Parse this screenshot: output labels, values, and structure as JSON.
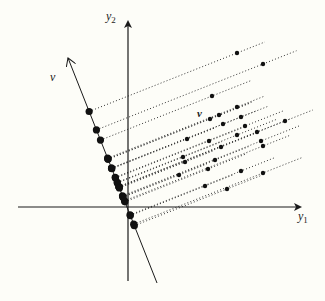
{
  "figure": {
    "background": "#fdfdf8",
    "ink": "#1a1a1a",
    "axis_labels": {
      "x": "y",
      "x_sub": "1",
      "y": "y",
      "y_sub": "2",
      "direction": "v",
      "cloud": "v"
    }
  },
  "chart_data": {
    "type": "scatter",
    "title": "",
    "xlabel": "y1",
    "ylabel": "y2",
    "direction_vector": {
      "label": "v",
      "y1": -0.37,
      "y2": 0.93
    },
    "projection_lines": "dotted, orthogonal to v",
    "points": [
      [
        10.9,
        15.4
      ],
      [
        13.5,
        14.3
      ],
      [
        8.4,
        11.1
      ],
      [
        10.9,
        10.0
      ],
      [
        9.1,
        9.2
      ],
      [
        8.2,
        8.8
      ],
      [
        11.3,
        9.0
      ],
      [
        9.5,
        8.3
      ],
      [
        11.7,
        8.1
      ],
      [
        15.7,
        8.6
      ],
      [
        12.9,
        7.5
      ],
      [
        10.9,
        7.2
      ],
      [
        5.9,
        6.8
      ],
      [
        8.1,
        6.6
      ],
      [
        13.3,
        6.6
      ],
      [
        13.5,
        6.1
      ],
      [
        9.3,
        6.0
      ],
      [
        5.5,
        5.0
      ],
      [
        5.7,
        4.5
      ],
      [
        8.7,
        4.7
      ],
      [
        8.0,
        3.8
      ],
      [
        5.1,
        3.2
      ],
      [
        11.3,
        3.6
      ],
      [
        13.5,
        3.4
      ],
      [
        7.7,
        2.1
      ],
      [
        9.9,
        1.8
      ]
    ]
  }
}
